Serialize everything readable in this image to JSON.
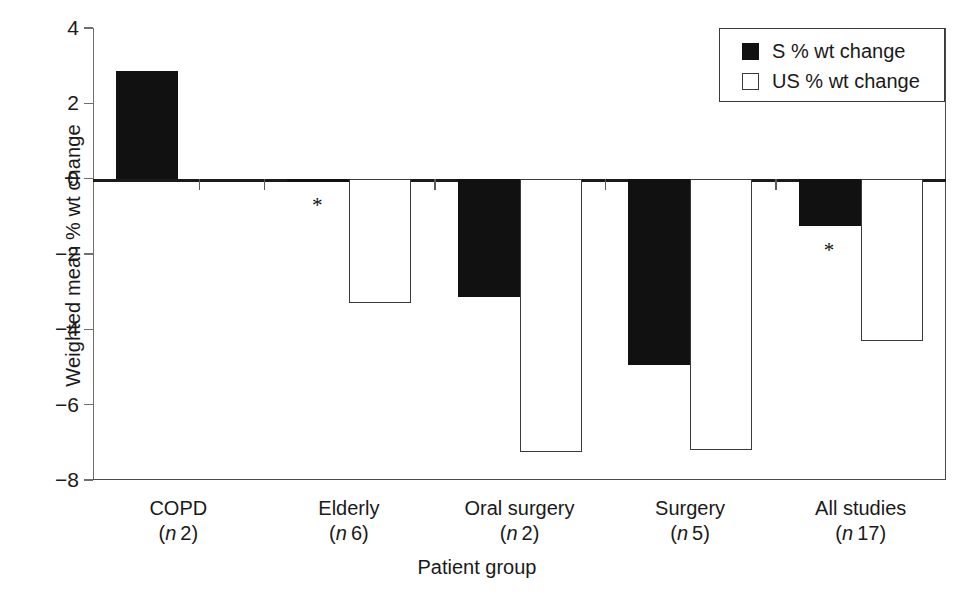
{
  "chart_data": {
    "type": "bar",
    "title": "",
    "xlabel": "Patient group",
    "ylabel": "Weighted mean % wt change",
    "categories": [
      "COPD",
      "Elderly",
      "Oral surgery",
      "Surgery",
      "All studies"
    ],
    "category_n": [
      "(n 2)",
      "(n 6)",
      "(n 2)",
      "(n 5)",
      "(n 17)"
    ],
    "n_values": [
      2,
      6,
      2,
      5,
      17
    ],
    "series": [
      {
        "name": "S % wt change",
        "values": [
          2.85,
          -0.05,
          -3.15,
          -4.95,
          -1.25
        ]
      },
      {
        "name": "US % wt change",
        "values": [
          0,
          -3.3,
          -7.25,
          -7.2,
          -4.3
        ]
      }
    ],
    "ylim": [
      -8,
      4
    ],
    "yticks": [
      4,
      2,
      0,
      -2,
      -4,
      -6,
      -8
    ],
    "ytick_labels": [
      "4",
      "2",
      "0",
      "−2",
      "−4",
      "−6",
      "−8"
    ],
    "grid": false,
    "legend_position": "top-right",
    "annotations": [
      {
        "text": "*",
        "category": "Elderly",
        "series": "S % wt change"
      },
      {
        "text": "*",
        "category": "All studies",
        "series": "S % wt change"
      }
    ]
  },
  "legend": {
    "items": [
      {
        "label": "S % wt change",
        "swatch": "filled-square"
      },
      {
        "label": "US % wt change",
        "swatch": "open-square"
      }
    ]
  },
  "axes": {
    "y_title": "Weighted mean % wt change",
    "x_title": "Patient group"
  },
  "caption": {
    "text": ""
  }
}
